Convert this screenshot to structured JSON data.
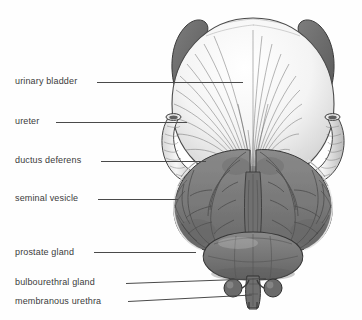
{
  "figure": {
    "kind": "anatomical-illustration",
    "style": "grayscale engraving",
    "background_color": "#fefefe",
    "label_color": "#3b3b3b",
    "leader_color": "#4a4a4a"
  },
  "labels": [
    {
      "id": "urinary-bladder",
      "text": "urinary bladder",
      "x": 15,
      "y": 76,
      "leader_x": 97,
      "leader_y": 82,
      "leader_w": 146,
      "leader_tilt": 0
    },
    {
      "id": "ureter",
      "text": "ureter",
      "x": 15,
      "y": 116,
      "leader_x": 56,
      "leader_y": 122,
      "leader_w": 131,
      "leader_tilt": 0
    },
    {
      "id": "ductus-deferens",
      "text": "ductus deferens",
      "x": 15,
      "y": 155,
      "leader_x": 101,
      "leader_y": 161,
      "leader_w": 105,
      "leader_tilt": 0
    },
    {
      "id": "seminal-vesicle",
      "text": "seminal vesicle",
      "x": 15,
      "y": 193,
      "leader_x": 98,
      "leader_y": 199,
      "leader_w": 80,
      "leader_tilt": 0
    },
    {
      "id": "prostate-gland",
      "text": "prostate gland",
      "x": 15,
      "y": 247,
      "leader_x": 94,
      "leader_y": 252,
      "leader_w": 102,
      "leader_tilt": 0
    },
    {
      "id": "bulbourethral-gland",
      "text": "bulbourethral gland",
      "x": 15,
      "y": 277,
      "leader_x": 126,
      "leader_y": 283,
      "leader_w": 140,
      "leader_tilt": -2
    },
    {
      "id": "membranous-urethra",
      "text": "membranous urethra",
      "x": 15,
      "y": 296,
      "leader_x": 128,
      "leader_y": 301,
      "leader_w": 124,
      "leader_tilt": -3
    }
  ],
  "structures": {
    "bladder": {
      "name": "urinary bladder",
      "fill": "#fbfbfb",
      "stroke": "#4e4e4e"
    },
    "detrusor_fibers": {
      "name": "detrusor muscle fibers",
      "stroke": "#6b6b6b"
    },
    "ureter_left": {
      "name": "left ureter",
      "fill": "#e9e9e9",
      "stroke": "#464646"
    },
    "ureter_right": {
      "name": "right ureter",
      "fill": "#e9e9e9",
      "stroke": "#464646"
    },
    "ductus_left": {
      "name": "left ductus deferens",
      "fill": "#6e6e6e",
      "stroke": "#3a3a3a"
    },
    "ductus_right": {
      "name": "right ductus deferens",
      "fill": "#6e6e6e",
      "stroke": "#3a3a3a"
    },
    "seminal_left": {
      "name": "left seminal vesicle",
      "fill": "#7b7b7b",
      "stroke": "#3a3a3a"
    },
    "seminal_right": {
      "name": "right seminal vesicle",
      "fill": "#7b7b7b",
      "stroke": "#3a3a3a"
    },
    "prostate": {
      "name": "prostate gland",
      "fill": "#767676",
      "stroke": "#3a3a3a"
    },
    "bulbo_left": {
      "name": "left bulbourethral gland",
      "fill": "#6a6a6a",
      "stroke": "#333333"
    },
    "bulbo_right": {
      "name": "right bulbourethral gland",
      "fill": "#6a6a6a",
      "stroke": "#333333"
    },
    "membranous_urethra": {
      "name": "membranous urethra",
      "fill": "#6f6f6f",
      "stroke": "#333333"
    }
  }
}
